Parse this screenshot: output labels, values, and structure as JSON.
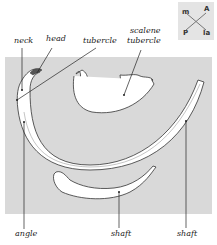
{
  "figure": {
    "labels": {
      "neck": "neck",
      "head": "head",
      "tubercle": "tubercle",
      "scalene_tubercle": [
        "scalene",
        "tubercle"
      ],
      "angle": "angle",
      "shaft_1": "shaft",
      "shaft_2": "shaft"
    },
    "orientation": {
      "top_left": "m",
      "top_right": "A",
      "bottom_left": "P",
      "bottom_right": "la"
    },
    "colors": {
      "background": "#d9d9d9",
      "bone": "#ffffff",
      "outline": "#333333"
    }
  }
}
